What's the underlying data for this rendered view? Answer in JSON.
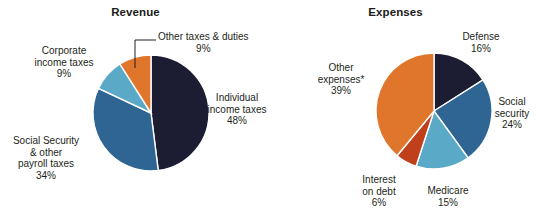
{
  "figure": {
    "background_color": "#ffffff",
    "text_color": "#231f20"
  },
  "charts": [
    {
      "id": "revenue",
      "title": "Revenue",
      "type": "pie",
      "start_angle_deg": 0,
      "direction": "clockwise",
      "center": {
        "x": 151,
        "y": 113
      },
      "radius": 58,
      "slices": [
        {
          "label": "Individual income taxes",
          "value": 48,
          "value_text": "48%",
          "color": "#1c1c33"
        },
        {
          "label": "Social Security & other payroll taxes",
          "value": 34,
          "value_text": "34%",
          "color": "#2e6593"
        },
        {
          "label": "Corporate income taxes",
          "value": 9,
          "value_text": "9%",
          "color": "#5aa9c6"
        },
        {
          "label": "Other taxes & duties",
          "value": 9,
          "value_text": "9%",
          "color": "#e0752c"
        }
      ],
      "labels": [
        {
          "name": "other-taxes-and-duties",
          "lines": [
            "Other taxes & duties"
          ],
          "value_text": "9%",
          "align": "left",
          "has_leader_line": true
        },
        {
          "name": "individual-income-taxes",
          "lines": [
            "Individual",
            "income taxes"
          ],
          "value_text": "48%",
          "align": "center",
          "has_leader_line": false
        },
        {
          "name": "social-security-payroll-taxes",
          "lines": [
            "Social Security",
            "& other",
            "payroll taxes"
          ],
          "value_text": "34%",
          "align": "center",
          "has_leader_line": false
        },
        {
          "name": "corporate-income-taxes",
          "lines": [
            "Corporate",
            "income taxes"
          ],
          "value_text": "9%",
          "align": "center",
          "has_leader_line": false
        }
      ]
    },
    {
      "id": "expenses",
      "title": "Expenses",
      "type": "pie",
      "start_angle_deg": 0,
      "direction": "clockwise",
      "center": {
        "x": 434,
        "y": 111
      },
      "radius": 58,
      "slices": [
        {
          "label": "Defense",
          "value": 16,
          "value_text": "16%",
          "color": "#1c1c33"
        },
        {
          "label": "Social security",
          "value": 24,
          "value_text": "24%",
          "color": "#2e6593"
        },
        {
          "label": "Medicare",
          "value": 15,
          "value_text": "15%",
          "color": "#5aa9c6"
        },
        {
          "label": "Interest on debt",
          "value": 6,
          "value_text": "6%",
          "color": "#c1401c"
        },
        {
          "label": "Other expenses*",
          "value": 39,
          "value_text": "39%",
          "color": "#e0752c"
        }
      ],
      "labels": [
        {
          "name": "defense",
          "lines": [
            "Defense"
          ],
          "value_text": "16%",
          "align": "center",
          "has_leader_line": false
        },
        {
          "name": "social-security",
          "lines": [
            "Social",
            "security"
          ],
          "value_text": "24%",
          "align": "center",
          "has_leader_line": false
        },
        {
          "name": "medicare",
          "lines": [
            "Medicare"
          ],
          "value_text": "15%",
          "align": "center",
          "has_leader_line": false
        },
        {
          "name": "interest-on-debt",
          "lines": [
            "Interest",
            "on debt"
          ],
          "value_text": "6%",
          "align": "center",
          "has_leader_line": false
        },
        {
          "name": "other-expenses",
          "lines": [
            "Other",
            "expenses*"
          ],
          "value_text": "39%",
          "align": "center",
          "has_leader_line": false
        }
      ]
    }
  ],
  "chart_data": [
    {
      "type": "pie",
      "title": "Revenue",
      "xlabel": "",
      "ylabel": "",
      "legend_position": "none",
      "grid": false,
      "units": "percent of total",
      "categories": [
        "Individual income taxes",
        "Social Security & other payroll taxes",
        "Corporate income taxes",
        "Other taxes & duties"
      ],
      "values": [
        48,
        34,
        9,
        9
      ],
      "colors": [
        "#1c1c33",
        "#2e6593",
        "#5aa9c6",
        "#e0752c"
      ],
      "data_labels": [
        "48%",
        "34%",
        "9%",
        "9%"
      ],
      "annotations": []
    },
    {
      "type": "pie",
      "title": "Expenses",
      "xlabel": "",
      "ylabel": "",
      "legend_position": "none",
      "grid": false,
      "units": "percent of total",
      "categories": [
        "Defense",
        "Social security",
        "Medicare",
        "Interest on debt",
        "Other expenses*"
      ],
      "values": [
        16,
        24,
        15,
        6,
        39
      ],
      "colors": [
        "#1c1c33",
        "#2e6593",
        "#5aa9c6",
        "#c1401c",
        "#e0752c"
      ],
      "data_labels": [
        "16%",
        "24%",
        "15%",
        "6%",
        "39%"
      ],
      "annotations": [
        "* asterisk marks Other expenses category"
      ]
    }
  ],
  "labels": {
    "revenue": {
      "other_taxes": {
        "l1": "Other taxes & duties",
        "v": "9%"
      },
      "individual": {
        "l1": "Individual",
        "l2": "income taxes",
        "v": "48%"
      },
      "social_security": {
        "l1": "Social Security",
        "l2": "& other",
        "l3": "payroll taxes",
        "v": "34%"
      },
      "corporate": {
        "l1": "Corporate",
        "l2": "income taxes",
        "v": "9%"
      }
    },
    "expenses": {
      "defense": {
        "l1": "Defense",
        "v": "16%"
      },
      "social_security": {
        "l1": "Social",
        "l2": "security",
        "v": "24%"
      },
      "medicare": {
        "l1": "Medicare",
        "v": "15%"
      },
      "interest": {
        "l1": "Interest",
        "l2": "on debt",
        "v": "6%"
      },
      "other": {
        "l1": "Other",
        "l2": "expenses*",
        "v": "39%"
      }
    }
  },
  "titles": {
    "revenue": "Revenue",
    "expenses": "Expenses"
  }
}
